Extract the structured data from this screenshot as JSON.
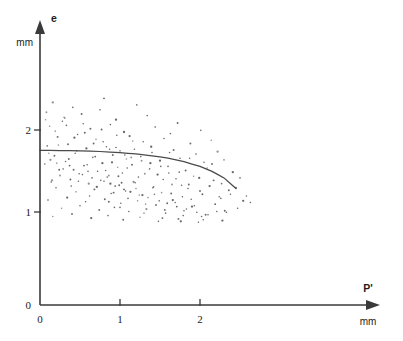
{
  "figure": {
    "background_color": "#ffffff",
    "ink_color": "#3a3a3a",
    "dot_color": "#5a5a5a",
    "curve_color": "#4a4a4a"
  },
  "chart_data": {
    "type": "scatter",
    "title": "",
    "subtitle": "",
    "xlabel": "P'",
    "ylabel": "e",
    "x_unit": "mm",
    "y_unit": "mm",
    "xlim": [
      0,
      4.4
    ],
    "ylim": [
      0,
      2.95
    ],
    "xticks": [
      0,
      1,
      2
    ],
    "xticklabels": [
      "0",
      "1",
      "2"
    ],
    "yticks": [
      0,
      1,
      2
    ],
    "yticklabels": [
      "0",
      "1",
      "2"
    ],
    "grid": false,
    "legend": null,
    "annotations": [],
    "x": [
      0.16,
      0.41,
      0.75,
      0.8,
      1.21,
      0.3,
      0.52,
      0.95,
      1.34,
      1.72,
      0.12,
      0.28,
      0.63,
      0.88,
      1.05,
      1.44,
      1.63,
      2.01,
      0.22,
      0.47,
      0.7,
      1.12,
      1.29,
      1.55,
      1.88,
      2.14,
      0.09,
      0.35,
      0.58,
      0.83,
      1.0,
      1.18,
      1.4,
      1.67,
      1.95,
      2.22,
      0.18,
      0.44,
      0.66,
      0.91,
      1.08,
      1.26,
      1.5,
      1.75,
      2.05,
      2.3,
      0.06,
      0.32,
      0.55,
      0.78,
      0.97,
      1.15,
      1.37,
      1.6,
      1.82,
      2.09,
      2.41,
      0.24,
      0.49,
      0.72,
      0.86,
      1.03,
      1.23,
      1.47,
      1.7,
      1.92,
      2.17,
      2.5,
      0.14,
      0.38,
      0.61,
      0.8,
      0.99,
      1.19,
      1.42,
      1.65,
      1.85,
      2.12,
      2.36,
      0.2,
      0.45,
      0.68,
      0.89,
      1.07,
      1.28,
      1.52,
      1.78,
      2.03,
      2.26,
      2.58,
      0.1,
      0.34,
      0.57,
      0.81,
      1.01,
      1.22,
      1.45,
      1.69,
      1.9,
      2.19,
      0.27,
      0.5,
      0.74,
      0.93,
      1.11,
      1.33,
      1.57,
      1.8,
      2.07,
      2.33,
      0.16,
      0.4,
      0.64,
      0.85,
      1.04,
      1.25,
      1.48,
      1.73,
      1.98,
      2.28,
      0.08,
      0.31,
      0.54,
      0.77,
      0.96,
      1.16,
      1.39,
      1.62,
      1.87,
      2.15,
      0.23,
      0.46,
      0.69,
      0.9,
      1.09,
      1.31,
      1.54,
      1.77,
      2.0,
      2.24,
      0.13,
      0.37,
      0.6,
      0.84,
      1.02,
      1.2,
      1.43,
      1.66,
      1.93,
      2.21,
      0.29,
      0.53,
      0.76,
      0.94,
      1.13,
      1.35,
      1.59,
      1.83,
      2.1,
      2.45,
      0.19,
      0.43,
      0.67,
      0.87,
      1.06,
      1.27,
      1.51,
      1.74,
      1.99,
      2.38,
      0.11,
      0.36,
      0.59,
      0.82,
      0.98,
      1.17,
      1.41,
      1.64,
      1.89,
      2.27,
      0.25,
      0.48,
      0.71,
      0.92,
      1.1,
      1.32,
      1.56,
      1.79,
      2.04,
      2.54,
      0.07,
      0.33,
      0.56,
      0.79,
      0.95,
      1.14,
      1.38,
      1.61,
      1.86,
      2.63,
      0.21,
      0.42,
      0.65,
      0.88,
      1.05,
      1.24,
      1.49,
      1.71,
      1.96,
      2.47,
      0.15,
      0.39,
      0.62,
      0.86,
      1.0,
      1.3,
      1.53,
      1.76,
      2.02,
      2.31
    ],
    "y": [
      2.47,
      2.41,
      2.38,
      2.52,
      2.44,
      2.29,
      2.33,
      2.26,
      2.31,
      2.22,
      2.18,
      2.24,
      2.15,
      2.2,
      2.11,
      2.17,
      2.09,
      2.13,
      2.05,
      2.08,
      2.02,
      2.06,
      1.99,
      2.03,
      1.97,
      2.01,
      1.94,
      1.96,
      1.91,
      1.93,
      1.88,
      1.9,
      1.86,
      1.89,
      1.84,
      1.87,
      1.82,
      1.85,
      1.8,
      1.83,
      1.78,
      1.81,
      1.76,
      1.79,
      1.74,
      1.77,
      1.72,
      1.75,
      1.7,
      1.73,
      1.68,
      1.71,
      1.66,
      1.69,
      1.64,
      1.67,
      1.62,
      1.65,
      1.6,
      1.63,
      1.58,
      1.61,
      1.56,
      1.59,
      1.54,
      1.57,
      1.52,
      1.55,
      1.5,
      1.53,
      1.48,
      1.51,
      1.46,
      1.49,
      1.44,
      1.47,
      1.42,
      1.45,
      1.4,
      1.43,
      1.38,
      1.41,
      1.36,
      1.39,
      1.34,
      1.37,
      1.32,
      1.35,
      1.3,
      1.33,
      1.28,
      1.31,
      1.26,
      1.29,
      1.24,
      1.27,
      1.22,
      1.25,
      1.2,
      1.23,
      1.18,
      1.21,
      1.16,
      1.19,
      1.14,
      1.17,
      1.12,
      1.15,
      1.1,
      1.13,
      1.08,
      1.11,
      1.06,
      1.09,
      1.04,
      1.07,
      1.02,
      1.05,
      1.01,
      1.03,
      2.35,
      2.28,
      2.21,
      2.14,
      2.07,
      2.0,
      1.93,
      1.86,
      1.79,
      1.72,
      1.95,
      1.88,
      1.81,
      1.74,
      1.67,
      1.6,
      1.53,
      1.46,
      1.39,
      1.32,
      1.77,
      1.7,
      1.63,
      1.56,
      1.49,
      1.42,
      1.35,
      1.28,
      1.21,
      1.14,
      1.66,
      1.59,
      1.52,
      1.45,
      1.38,
      1.31,
      1.24,
      1.17,
      1.1,
      1.43,
      2.12,
      2.04,
      1.97,
      1.9,
      1.83,
      1.76,
      1.69,
      1.62,
      1.55,
      1.35,
      1.85,
      1.78,
      1.71,
      1.64,
      1.57,
      1.5,
      1.43,
      1.36,
      1.29,
      1.48,
      1.58,
      1.51,
      1.44,
      1.37,
      1.3,
      1.23,
      1.16,
      1.09,
      1.04,
      1.27,
      2.26,
      2.19,
      2.1,
      1.99,
      1.92,
      1.8,
      1.73,
      1.61,
      1.47,
      1.25,
      1.73,
      1.65,
      1.55,
      1.48,
      1.41,
      1.34,
      1.27,
      1.2,
      1.13,
      1.18,
      1.52,
      1.45,
      1.33,
      1.26,
      1.19,
      1.12,
      1.06,
      1.02,
      1.08,
      1.15
    ],
    "curve": {
      "label": "",
      "x": [
        0.0,
        0.25,
        0.5,
        0.75,
        1.0,
        1.2,
        1.4,
        1.6,
        1.8,
        2.0,
        2.15,
        2.3,
        2.45
      ],
      "y": [
        1.885,
        1.884,
        1.88,
        1.872,
        1.858,
        1.842,
        1.82,
        1.79,
        1.748,
        1.69,
        1.63,
        1.55,
        1.42
      ]
    }
  },
  "labels": {
    "y_axis_name": "e",
    "y_axis_unit": "mm",
    "x_axis_name": "P'",
    "x_axis_unit": "mm",
    "y_tick_2": "2",
    "y_tick_1": "1",
    "y_tick_0": "0",
    "x_tick_0": "0",
    "x_tick_1": "1",
    "x_tick_2": "2"
  }
}
